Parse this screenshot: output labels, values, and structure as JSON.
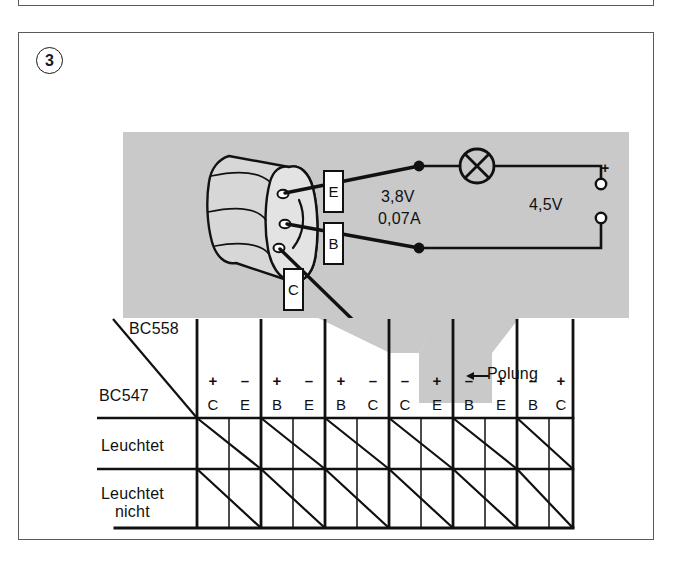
{
  "task": {
    "number": "3"
  },
  "circuit": {
    "transistor_leads": [
      {
        "id": "lead-e",
        "label": "E"
      },
      {
        "id": "lead-b",
        "label": "B"
      },
      {
        "id": "lead-c",
        "label": "C"
      }
    ],
    "lamp": {
      "icon": "lamp-icon",
      "voltage": "3,8V",
      "current": "0,07A"
    },
    "battery": {
      "voltage": "4,5V",
      "positive_marker": "+"
    }
  },
  "table": {
    "axis_label_top": "BC558",
    "axis_label_left": "BC547",
    "polung_label": "Polung",
    "polung_arrow_icon": "arrow-left-icon",
    "row_labels": [
      {
        "id": "row-leuchtet",
        "line1": "Leuchtet",
        "line2": ""
      },
      {
        "id": "row-leuchtet-nicht",
        "line1": "Leuchtet",
        "line2": "nicht"
      }
    ],
    "column_groups": [
      {
        "index": 1,
        "highlighted": false,
        "cells": [
          {
            "sign": "+",
            "pin": "C"
          },
          {
            "sign": "–",
            "pin": "E"
          }
        ]
      },
      {
        "index": 2,
        "highlighted": false,
        "cells": [
          {
            "sign": "+",
            "pin": "B"
          },
          {
            "sign": "–",
            "pin": "E"
          }
        ]
      },
      {
        "index": 3,
        "highlighted": false,
        "cells": [
          {
            "sign": "+",
            "pin": "B"
          },
          {
            "sign": "–",
            "pin": "C"
          }
        ]
      },
      {
        "index": 4,
        "highlighted": false,
        "cells": [
          {
            "sign": "–",
            "pin": "C"
          },
          {
            "sign": "+",
            "pin": "E"
          }
        ]
      },
      {
        "index": 5,
        "highlighted": true,
        "cells": [
          {
            "sign": "–",
            "pin": "B"
          },
          {
            "sign": "+",
            "pin": "E"
          }
        ]
      },
      {
        "index": 6,
        "highlighted": false,
        "cells": [
          {
            "sign": "–",
            "pin": "B"
          },
          {
            "sign": "+",
            "pin": "C"
          }
        ]
      }
    ]
  },
  "colors": {
    "photo_background": "#c9c9c9",
    "ink": "#111111",
    "panel_border": "#5a5a5a",
    "paper": "#ffffff"
  }
}
